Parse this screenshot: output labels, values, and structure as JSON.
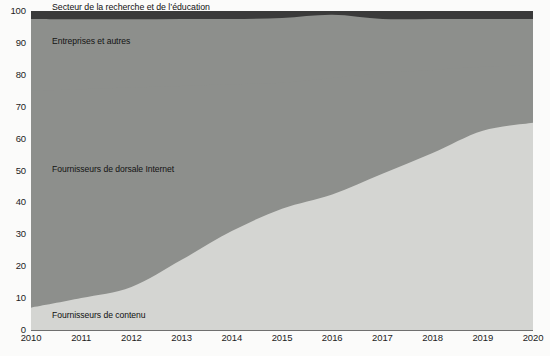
{
  "chart_data": {
    "type": "area",
    "stacked": true,
    "title": "",
    "subtitle": "",
    "xlabel": "",
    "ylabel": "",
    "xlim": [
      2010,
      2020
    ],
    "ylim": [
      0,
      100
    ],
    "grid": false,
    "legend_position": "inline-annotations",
    "categories": [
      2010,
      2011,
      2012,
      2013,
      2014,
      2015,
      2016,
      2017,
      2018,
      2019,
      2020
    ],
    "x_tick_labels": [
      "2010",
      "2011",
      "2012",
      "2013",
      "2014",
      "2015",
      "2016",
      "2017",
      "2018",
      "2019",
      "2020"
    ],
    "y_tick_labels": [
      "0",
      "10",
      "20",
      "30",
      "40",
      "50",
      "60",
      "70",
      "80",
      "90",
      "100"
    ],
    "y_ticks": [
      0,
      10,
      20,
      30,
      40,
      50,
      60,
      70,
      80,
      90,
      100
    ],
    "series": [
      {
        "name": "Fournisseurs de contenu",
        "color": "#d4d5d2",
        "label_inside": true,
        "values": [
          7,
          10,
          13.5,
          22,
          31,
          38,
          42.5,
          49,
          55.5,
          62.5,
          65
        ]
      },
      {
        "name": "Fournisseurs de dorsale Internet",
        "color": "#8d8f8c",
        "label_inside": true,
        "values": [
          68,
          65.5,
          62.5,
          54.5,
          46,
          39.5,
          36.5,
          31.5,
          26,
          20,
          18
        ]
      },
      {
        "name": "Entreprises et autres",
        "color": "#8d8f8c",
        "label_inside": true,
        "values": [
          22.5,
          21.9,
          21.4,
          21.0,
          20.5,
          20.3,
          19.8,
          17.0,
          16.0,
          15.0,
          14.5
        ]
      },
      {
        "name": "Secteur de la recherche et de l'éducation",
        "color": "#3a3a3a",
        "label_inside": false,
        "values": [
          2.5,
          2.6,
          2.6,
          2.5,
          2.5,
          2.2,
          1.2,
          2.5,
          2.5,
          2.5,
          2.5
        ]
      }
    ],
    "annotations": [
      {
        "text": "Secteur de la recherche et de l’éducation",
        "series": "Secteur de la recherche et de l’éducation",
        "placement": "above-plot"
      },
      {
        "text": "Entreprises et autres",
        "series": "Entreprises et autres",
        "placement": "inside"
      },
      {
        "text": "Fournisseurs de dorsale Internet",
        "series": "Fournisseurs de dorsale Internet",
        "placement": "inside"
      },
      {
        "text": "Fournisseurs de contenu",
        "series": "Fournisseurs de contenu",
        "placement": "inside"
      }
    ]
  },
  "labels": {
    "top": "Secteur de la recherche et de l’éducation",
    "enterprises": "Entreprises et autres",
    "backbone": "Fournisseurs de dorsale Internet",
    "content": "Fournisseurs de contenu"
  },
  "colors": {
    "content": "#d4d5d2",
    "backbone": "#8d8f8c",
    "enterprises": "#8d8f8c",
    "research": "#3a3a3a",
    "axis": "#6f6f6f",
    "text": "#1d1d1d",
    "background": "#fbfbfa"
  },
  "source": {
    "text": ""
  }
}
